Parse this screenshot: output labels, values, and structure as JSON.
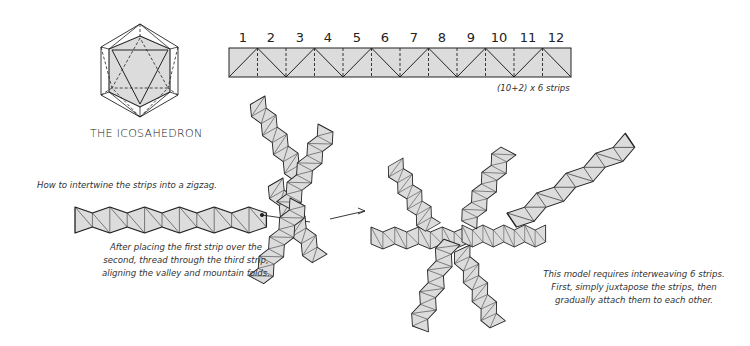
{
  "icosahedron": {
    "caption": "THE ICOSAHEDRON"
  },
  "strip": {
    "numbers": [
      "1",
      "2",
      "3",
      "4",
      "5",
      "6",
      "7",
      "8",
      "9",
      "10",
      "11",
      "12"
    ],
    "caption": "(10+2) x 6 strips"
  },
  "zigzag": {
    "caption": "How to intertwine the strips into a zigzag."
  },
  "instructions_left": {
    "lines": [
      "After placing the first strip over the",
      "second, thread through the third strip,",
      "aligning the valley and mountain folds."
    ]
  },
  "instructions_right": {
    "lines": [
      "This model requires interweaving 6 strips.",
      "First, simply juxtapose the strips, then",
      "gradually attach them to each other."
    ]
  },
  "colors": {
    "fill": "#dcdcdc",
    "fill_dark": "#c8c8c8",
    "stroke": "#222222"
  }
}
